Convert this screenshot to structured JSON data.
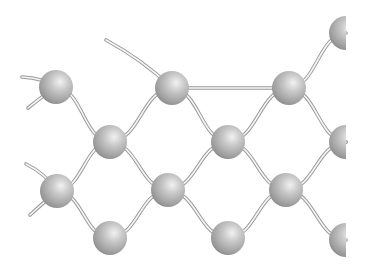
{
  "diagram": {
    "colors": {
      "background": "#ffffff",
      "sphere_light": "#e8e8e8",
      "sphere_mid": "#b4b4b4",
      "sphere_dark": "#7c7c7c",
      "bond_outline": "#9a9a9a",
      "bond_fill": "#f6f6f6"
    },
    "atoms": [
      {
        "id": "a1",
        "label": "atom-top-1"
      },
      {
        "id": "a2",
        "label": "atom-mid-1"
      },
      {
        "id": "a3",
        "label": "atom-top-2"
      },
      {
        "id": "a4",
        "label": "atom-mid-2"
      },
      {
        "id": "a5",
        "label": "atom-top-3"
      },
      {
        "id": "a6",
        "label": "atom-upper-right"
      },
      {
        "id": "a7",
        "label": "atom-mid-right"
      },
      {
        "id": "a8",
        "label": "atom-lower-1"
      },
      {
        "id": "a9",
        "label": "atom-bottom-1"
      },
      {
        "id": "a10",
        "label": "atom-lower-2"
      },
      {
        "id": "a11",
        "label": "atom-bottom-2"
      },
      {
        "id": "a12",
        "label": "atom-lower-3"
      },
      {
        "id": "a13",
        "label": "atom-bottom-right"
      }
    ],
    "bonds": [
      {
        "from": "stub-a1-left",
        "to": "a1"
      },
      {
        "from": "stub-a1-down",
        "to": "a1"
      },
      {
        "from": "a1",
        "to": "a2"
      },
      {
        "from": "a2",
        "to": "a3"
      },
      {
        "from": "stub-a3-up",
        "to": "a3"
      },
      {
        "from": "a3",
        "to": "a5"
      },
      {
        "from": "a3",
        "to": "a4"
      },
      {
        "from": "a4",
        "to": "a5"
      },
      {
        "from": "a5",
        "to": "a6"
      },
      {
        "from": "a5",
        "to": "a7"
      },
      {
        "from": "a2",
        "to": "a10"
      },
      {
        "from": "a4",
        "to": "a10"
      },
      {
        "from": "a4",
        "to": "a12"
      },
      {
        "from": "a7",
        "to": "a12"
      },
      {
        "from": "stub-a8-up",
        "to": "a8"
      },
      {
        "from": "stub-a8-down",
        "to": "a8"
      },
      {
        "from": "a2",
        "to": "a8"
      },
      {
        "from": "a8",
        "to": "a9"
      },
      {
        "from": "a9",
        "to": "a10"
      },
      {
        "from": "a10",
        "to": "a11"
      },
      {
        "from": "a11",
        "to": "a12"
      },
      {
        "from": "a12",
        "to": "a13"
      }
    ]
  }
}
